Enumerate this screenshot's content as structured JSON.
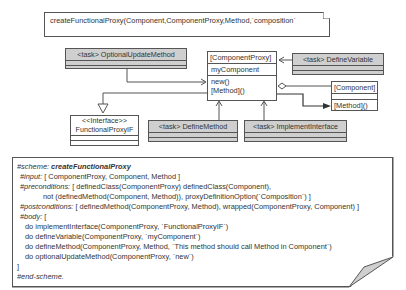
{
  "diagram": {
    "top_note": {
      "text": "createFunctionalProxy(Component,ComponentProxy,Method,`composition`"
    },
    "classes": {
      "optional_update_method": {
        "label": "<task> OptionalUpdateMethod"
      },
      "component_proxy": {
        "label": "[ComponentProxy]",
        "attributes": [
          "myComponent"
        ],
        "operations": [
          "new()",
          "[Method]()"
        ]
      },
      "define_variable": {
        "label": "<task> DefineVariable"
      },
      "component": {
        "label": "[Component]",
        "operations": [
          "[Method]()"
        ]
      },
      "interface": {
        "stereotype": "<<Interface>>",
        "label": "FunctionalProxyIF"
      },
      "define_method": {
        "label": "<task> DefineMethod"
      },
      "implement_interface": {
        "label": "<task> ImplementInterface"
      }
    },
    "colors": {
      "task_fill": "#cfcfcf",
      "line": "#555555",
      "background": "#ffffff"
    }
  },
  "scheme": {
    "scheme_kw": "#scheme:",
    "scheme_name": "createFunctionalProxy",
    "input_kw": "#input:",
    "input_val": "[ ComponentProxy, Component, Method ]",
    "pre_kw": "#preconditions:",
    "pre_val1": "[ definedClass(ComponentProxy) definedClass(Component),",
    "pre_val2": "not (definedMethod(Component, Method)), proxyDefinitionOption(`Composition`) ]",
    "post_kw": "#postconditions:",
    "post_val": "[ definedMethod(ComponentProxy, Method), wrapped(ComponentProxy, Component) ]",
    "body_kw": "#body:",
    "body_open": "[",
    "body_lines": [
      "do implementInterface(ComponentProxy, `FunctionalProxyIF`)",
      "do defineVariable(ComponentProxy, `myComponent`)",
      "do defineMethod(ComponentProxy, Method, `This method should call Method in Component`)",
      "do optionalUpdateMethod(ComponentProxy, `new`)"
    ],
    "body_close": "]",
    "end_kw": "#end-scheme."
  }
}
